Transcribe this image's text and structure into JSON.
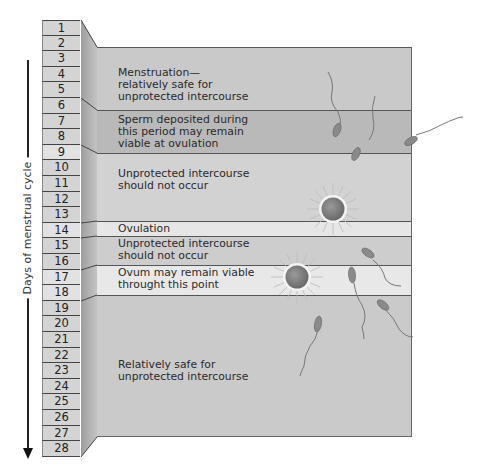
{
  "axis": {
    "label": "Days of menstrual cycle"
  },
  "days": [
    "1",
    "2",
    "3",
    "4",
    "5",
    "6",
    "7",
    "8",
    "9",
    "10",
    "11",
    "12",
    "13",
    "14",
    "15",
    "16",
    "17",
    "18",
    "19",
    "20",
    "21",
    "22",
    "23",
    "24",
    "25",
    "26",
    "27",
    "28"
  ],
  "bands": [
    {
      "id": "menstruation",
      "text": "Menstruation—\nrelatively safe for\nunprotected intercourse",
      "top": 47,
      "height": 63,
      "color": "#c9c9c9",
      "text_top": 19
    },
    {
      "id": "sperm-viable",
      "text": "Sperm deposited during\nthis period may remain\nviable at ovulation",
      "top": 110,
      "height": 43,
      "color": "#b9b9b9",
      "text_top": 3
    },
    {
      "id": "unprotected-1",
      "text": "Unprotected intercourse\nshould not occur",
      "top": 153,
      "height": 68,
      "color": "#d2d2d2",
      "text_top": 14
    },
    {
      "id": "ovulation",
      "text": "Ovulation",
      "top": 221,
      "height": 15,
      "color": "#e6e6e6",
      "text_top": 1
    },
    {
      "id": "unprotected-2",
      "text": "Unprotected intercourse\nshould not occur",
      "top": 236,
      "height": 29,
      "color": "#cdcdcd",
      "text_top": 1
    },
    {
      "id": "ovum-viable",
      "text": "Ovum may remain viable\nthrought this point",
      "top": 265,
      "height": 30,
      "color": "#e8e8e8",
      "text_top": 1
    },
    {
      "id": "safe",
      "text": "Relatively safe for\nunprotected intercourse",
      "top": 295,
      "height": 142,
      "color": "#cacaca",
      "text_top": 63
    }
  ],
  "colors": {
    "day_cell": "#d4d4d4",
    "side_face": "#a8a8a8",
    "ovum": "#7d7d7d",
    "sperm": "#8a8a8a"
  }
}
